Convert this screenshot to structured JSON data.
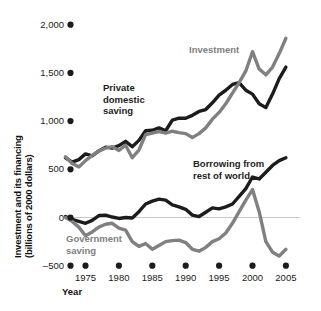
{
  "chart_data": {
    "type": "line",
    "title": "",
    "xlabel": "Year",
    "ylabel": "Investment and its financing\n(billions of 2000 dollars)",
    "ylabel_line1": "Investment and its financing",
    "ylabel_line2": "(billions of 2000 dollars)",
    "xlim": [
      1972,
      2006
    ],
    "ylim": [
      -500,
      2000
    ],
    "ytick_values": [
      2000,
      1500,
      1000,
      500,
      0,
      -500
    ],
    "ytick_labels": [
      "2,000",
      "1,500",
      "1,000",
      "500",
      "0",
      "–500"
    ],
    "xtick_values": [
      1975,
      1980,
      1985,
      1990,
      1995,
      2000,
      2005
    ],
    "xtick_labels": [
      "1975",
      "1980",
      "1985",
      "1990",
      "1995",
      "2000",
      "2005"
    ],
    "grid": false,
    "zero_line": true,
    "tick_style": "dot-markers",
    "legend_position": "inline-annotations",
    "colors": {
      "dark": "#1c1c1c",
      "gray": "#808080",
      "zero_line": "#c9c9c9",
      "text": "#1a1a1a"
    },
    "x": [
      1972,
      1973,
      1974,
      1975,
      1976,
      1977,
      1978,
      1979,
      1980,
      1981,
      1982,
      1983,
      1984,
      1985,
      1986,
      1987,
      1988,
      1989,
      1990,
      1991,
      1992,
      1993,
      1994,
      1995,
      1996,
      1997,
      1998,
      1999,
      2000,
      2001,
      2002,
      2003,
      2004,
      2005
    ],
    "series": [
      {
        "name": "Private domestic saving",
        "color": "#1c1c1c",
        "label_lines": [
          "Private",
          "domestic",
          "saving"
        ],
        "values": [
          620,
          575,
          600,
          660,
          640,
          690,
          730,
          720,
          745,
          790,
          735,
          800,
          900,
          905,
          930,
          900,
          1010,
          1030,
          1030,
          1060,
          1100,
          1120,
          1190,
          1270,
          1320,
          1380,
          1400,
          1320,
          1280,
          1180,
          1140,
          1280,
          1440,
          1560
        ]
      },
      {
        "name": "Investment",
        "color": "#808080",
        "label_lines": [
          "Investment"
        ],
        "values": [
          630,
          560,
          525,
          590,
          645,
          690,
          720,
          735,
          695,
          750,
          620,
          700,
          860,
          875,
          890,
          875,
          895,
          880,
          870,
          830,
          870,
          930,
          1020,
          1090,
          1180,
          1290,
          1400,
          1520,
          1720,
          1540,
          1480,
          1560,
          1700,
          1860
        ]
      },
      {
        "name": "Borrowing from rest of world",
        "color": "#1c1c1c",
        "label_lines": [
          "Borrowing from",
          "rest of world"
        ],
        "values": [
          10,
          -20,
          -40,
          -60,
          -30,
          20,
          25,
          5,
          -10,
          0,
          -5,
          60,
          140,
          170,
          190,
          180,
          130,
          110,
          85,
          25,
          10,
          55,
          100,
          90,
          110,
          140,
          220,
          300,
          420,
          400,
          470,
          540,
          590,
          620
        ]
      },
      {
        "name": "Government saving",
        "color": "#808080",
        "label_lines": [
          "Government",
          "saving"
        ],
        "values": [
          0,
          -40,
          -100,
          -190,
          -150,
          -100,
          -70,
          -60,
          -110,
          -130,
          -250,
          -300,
          -270,
          -330,
          -290,
          -250,
          -240,
          -235,
          -260,
          -330,
          -350,
          -310,
          -250,
          -220,
          -160,
          -60,
          60,
          180,
          290,
          60,
          -250,
          -360,
          -400,
          -330
        ]
      }
    ]
  }
}
